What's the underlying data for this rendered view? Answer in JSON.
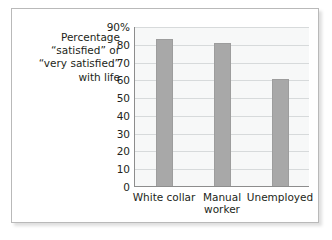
{
  "chart_data": {
    "type": "bar",
    "title": "",
    "subtitle": "",
    "xlabel": "",
    "ylabel": "Percentage\n“satisfied” or\n“very satisfied”\nwith life",
    "categories": [
      "White collar",
      "Manual\nworker",
      "Unemployed"
    ],
    "values": [
      83,
      81,
      61
    ],
    "series": [
      {
        "name": "Percentage satisfied or very satisfied with life",
        "values": [
          83,
          81,
          61
        ]
      }
    ],
    "ylim": [
      0,
      90
    ],
    "ytick_values": [
      90,
      80,
      70,
      60,
      50,
      40,
      30,
      20,
      10,
      0
    ],
    "ytick_labels": [
      "90%",
      "80",
      "70",
      "60",
      "50",
      "40",
      "30",
      "20",
      "10",
      "0"
    ],
    "grid": "horizontal",
    "legend": "none",
    "annotations": [],
    "colors": {
      "bar_fill": "#a8a8a8",
      "bar_stroke": "#9d9d9d",
      "plot_background": "#f7f8f8",
      "gridline": "#d7dadb",
      "axis_line": "#8d8d8d",
      "text": "#231f20",
      "frame_border": "#b9b9b9",
      "card_background": "#ffffff"
    }
  }
}
